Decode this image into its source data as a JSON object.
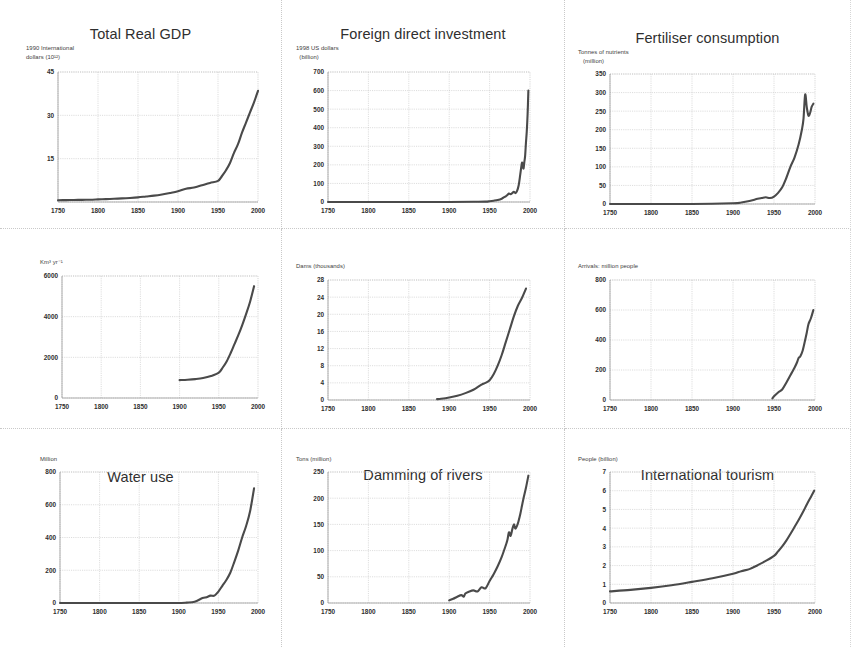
{
  "figure": {
    "background_color": "#ffffff",
    "line_color": "#4a4a4a",
    "grid_color": "#c4c4c4",
    "columns": 3,
    "rows": 3
  },
  "chart_data": [
    {
      "type": "line",
      "title": "Total Real GDP",
      "ylabel": "1990 International\ndollars (10¹²)",
      "xlabel": "",
      "xlim": [
        1750,
        2000
      ],
      "ylim": [
        0,
        45
      ],
      "xticks": [
        1750,
        1800,
        1850,
        1900,
        1950,
        2000
      ],
      "yticks": [
        0,
        15,
        30,
        45
      ],
      "ytick_labels": [
        "",
        "15",
        "30",
        "45"
      ],
      "grid": true,
      "legend": "none",
      "x": [
        1750,
        1760,
        1770,
        1780,
        1790,
        1800,
        1810,
        1820,
        1830,
        1840,
        1850,
        1860,
        1870,
        1880,
        1890,
        1900,
        1910,
        1920,
        1930,
        1940,
        1950,
        1955,
        1960,
        1965,
        1970,
        1975,
        1980,
        1985,
        1990,
        1995,
        2000
      ],
      "y": [
        0.6,
        0.65,
        0.7,
        0.75,
        0.8,
        0.9,
        1.0,
        1.1,
        1.25,
        1.4,
        1.6,
        1.9,
        2.2,
        2.6,
        3.1,
        3.7,
        4.6,
        5.0,
        5.8,
        6.6,
        7.3,
        9.0,
        11.0,
        13.5,
        17.0,
        20.0,
        24.0,
        27.5,
        31.0,
        34.5,
        38.5
      ]
    },
    {
      "type": "line",
      "title": "Foreign direct investment",
      "ylabel": "1998 US dollars\n  (billion)",
      "xlabel": "",
      "xlim": [
        1750,
        2000
      ],
      "ylim": [
        0,
        700
      ],
      "xticks": [
        1750,
        1800,
        1850,
        1900,
        1950,
        2000
      ],
      "yticks": [
        0,
        100,
        200,
        300,
        400,
        500,
        600,
        700
      ],
      "ytick_labels": [
        "0",
        "100",
        "200",
        "300",
        "400",
        "500",
        "600",
        "700"
      ],
      "grid": true,
      "legend": "none",
      "x": [
        1750,
        1800,
        1850,
        1900,
        1930,
        1945,
        1950,
        1955,
        1960,
        1965,
        1968,
        1970,
        1972,
        1974,
        1976,
        1978,
        1980,
        1982,
        1984,
        1986,
        1988,
        1990,
        1991,
        1992,
        1993,
        1994,
        1995,
        1996,
        1997,
        1998
      ],
      "y": [
        0,
        0,
        0,
        0,
        1,
        2,
        4,
        7,
        11,
        18,
        26,
        30,
        38,
        45,
        42,
        48,
        55,
        48,
        60,
        90,
        150,
        210,
        195,
        180,
        215,
        250,
        320,
        380,
        470,
        600
      ]
    },
    {
      "type": "line",
      "title": "Fertiliser consumption",
      "ylabel": "Tonnes of nutrients\n   (million)",
      "xlabel": "",
      "xlim": [
        1750,
        2000
      ],
      "ylim": [
        0,
        350
      ],
      "xticks": [
        1750,
        1800,
        1850,
        1900,
        1950,
        2000
      ],
      "yticks": [
        0,
        50,
        100,
        150,
        200,
        250,
        300,
        350
      ],
      "ytick_labels": [
        "0",
        "50",
        "100",
        "150",
        "200",
        "250",
        "300",
        "350"
      ],
      "grid": true,
      "legend": "none",
      "x": [
        1750,
        1850,
        1900,
        1910,
        1920,
        1930,
        1935,
        1940,
        1945,
        1950,
        1955,
        1960,
        1965,
        1970,
        1975,
        1980,
        1984,
        1986,
        1988,
        1990,
        1992,
        1994,
        1996,
        1998
      ],
      "y": [
        0,
        0,
        2,
        4,
        8,
        14,
        16,
        18,
        16,
        20,
        30,
        45,
        70,
        100,
        125,
        160,
        200,
        230,
        295,
        260,
        238,
        245,
        262,
        270
      ]
    },
    {
      "type": "line",
      "title": "Water use",
      "ylabel": "Km³ yr⁻¹",
      "xlabel": "",
      "xlim": [
        1750,
        2000
      ],
      "ylim": [
        0,
        6000
      ],
      "xticks": [
        1750,
        1800,
        1850,
        1900,
        1950,
        2000
      ],
      "yticks": [
        0,
        2000,
        4000,
        6000
      ],
      "ytick_labels": [
        "0",
        "2000",
        "4000",
        "6000"
      ],
      "grid": true,
      "legend": "none",
      "x": [
        1900,
        1910,
        1920,
        1930,
        1940,
        1950,
        1955,
        1960,
        1965,
        1970,
        1975,
        1980,
        1985,
        1990,
        1995
      ],
      "y": [
        880,
        900,
        930,
        980,
        1080,
        1250,
        1500,
        1800,
        2200,
        2650,
        3100,
        3600,
        4150,
        4750,
        5500
      ]
    },
    {
      "type": "line",
      "title": "Damming of rivers",
      "ylabel": "Dams (thousands)",
      "xlabel": "",
      "xlim": [
        1750,
        2000
      ],
      "ylim": [
        0,
        28
      ],
      "xticks": [
        1750,
        1800,
        1850,
        1900,
        1950,
        2000
      ],
      "yticks": [
        0,
        4,
        8,
        12,
        16,
        20,
        24,
        28
      ],
      "ytick_labels": [
        "0",
        "4",
        "8",
        "12",
        "16",
        "20",
        "24",
        "28"
      ],
      "grid": true,
      "legend": "none",
      "x": [
        1885,
        1890,
        1900,
        1910,
        1920,
        1930,
        1940,
        1945,
        1950,
        1955,
        1960,
        1965,
        1970,
        1975,
        1980,
        1985,
        1990,
        1995
      ],
      "y": [
        0.2,
        0.3,
        0.6,
        1.0,
        1.6,
        2.4,
        3.6,
        4.0,
        4.6,
        6.0,
        8.0,
        10.5,
        13.5,
        16.5,
        19.5,
        22.0,
        23.8,
        26.0
      ]
    },
    {
      "type": "line",
      "title": "International tourism",
      "ylabel": "Arrivals: million people",
      "xlabel": "",
      "xlim": [
        1750,
        2000
      ],
      "ylim": [
        0,
        800
      ],
      "xticks": [
        1750,
        1800,
        1850,
        1900,
        1950,
        2000
      ],
      "yticks": [
        0,
        200,
        400,
        600,
        800
      ],
      "ytick_labels": [
        "0",
        "200",
        "400",
        "600",
        "800"
      ],
      "grid": true,
      "legend": "none",
      "x": [
        1948,
        1950,
        1955,
        1960,
        1965,
        1970,
        1972,
        1975,
        1978,
        1980,
        1982,
        1985,
        1988,
        1990,
        1992,
        1995,
        1998
      ],
      "y": [
        10,
        25,
        50,
        70,
        115,
        165,
        185,
        215,
        250,
        280,
        290,
        330,
        400,
        450,
        505,
        545,
        600
      ]
    },
    {
      "type": "line",
      "title": "Motor vehicles",
      "ylabel": "Million",
      "xlabel": "",
      "xlim": [
        1750,
        2000
      ],
      "ylim": [
        0,
        800
      ],
      "xticks": [
        1750,
        1800,
        1850,
        1900,
        1950,
        2000
      ],
      "yticks": [
        0,
        200,
        400,
        600,
        800
      ],
      "ytick_labels": [
        "0",
        "200",
        "400",
        "600",
        "800"
      ],
      "grid": true,
      "legend": "none",
      "x": [
        1750,
        1800,
        1850,
        1900,
        1910,
        1920,
        1930,
        1935,
        1940,
        1945,
        1950,
        1955,
        1960,
        1965,
        1970,
        1975,
        1980,
        1985,
        1990,
        1995
      ],
      "y": [
        0,
        0,
        0,
        0,
        2,
        8,
        30,
        35,
        45,
        45,
        70,
        105,
        140,
        185,
        250,
        320,
        400,
        470,
        560,
        700
      ]
    },
    {
      "type": "line",
      "title": "Paper consumption",
      "ylabel": "Tons (million)",
      "xlabel": "",
      "xlim": [
        1750,
        2000
      ],
      "ylim": [
        0,
        250
      ],
      "xticks": [
        1750,
        1800,
        1850,
        1900,
        1950,
        2000
      ],
      "yticks": [
        0,
        50,
        100,
        150,
        200,
        250
      ],
      "ytick_labels": [
        "0",
        "50",
        "100",
        "150",
        "200",
        "250"
      ],
      "grid": true,
      "legend": "none",
      "x": [
        1900,
        1905,
        1910,
        1915,
        1918,
        1920,
        1925,
        1930,
        1935,
        1940,
        1945,
        1950,
        1955,
        1960,
        1965,
        1970,
        1972,
        1974,
        1976,
        1978,
        1980,
        1982,
        1985,
        1988,
        1990,
        1992,
        1995,
        1998
      ],
      "y": [
        5,
        8,
        12,
        15,
        12,
        18,
        22,
        24,
        22,
        30,
        28,
        42,
        55,
        70,
        88,
        110,
        120,
        135,
        128,
        140,
        150,
        142,
        152,
        170,
        185,
        200,
        220,
        243
      ]
    },
    {
      "type": "line",
      "title": "Population",
      "ylabel": "People (billion)",
      "xlabel": "",
      "xlim": [
        1750,
        2000
      ],
      "ylim": [
        0,
        7
      ],
      "xticks": [
        1750,
        1800,
        1850,
        1900,
        1950,
        2000
      ],
      "yticks": [
        0,
        1,
        2,
        3,
        4,
        5,
        6,
        7
      ],
      "ytick_labels": [
        "0",
        "1",
        "2",
        "3",
        "4",
        "5",
        "6",
        "7"
      ],
      "grid": true,
      "legend": "none",
      "x": [
        1750,
        1775,
        1800,
        1825,
        1850,
        1875,
        1900,
        1910,
        1920,
        1930,
        1940,
        1950,
        1955,
        1960,
        1965,
        1970,
        1975,
        1980,
        1985,
        1990,
        1995,
        1999
      ],
      "y": [
        0.62,
        0.7,
        0.81,
        0.95,
        1.13,
        1.32,
        1.56,
        1.7,
        1.81,
        2.02,
        2.25,
        2.52,
        2.76,
        3.02,
        3.33,
        3.69,
        4.06,
        4.43,
        4.83,
        5.26,
        5.67,
        6.0
      ]
    }
  ]
}
